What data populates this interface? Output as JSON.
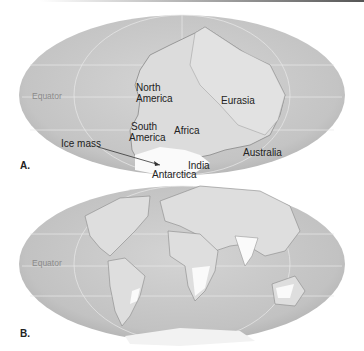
{
  "figure": {
    "panels": [
      {
        "id": "A",
        "label": "A.",
        "equator_label": "Equator",
        "continents": [
          "North America",
          "South America",
          "Africa",
          "Eurasia",
          "India",
          "Antarctica",
          "Australia"
        ],
        "annotations": [
          "Ice mass"
        ],
        "labels": {
          "north": "North",
          "america1": "America",
          "south": "South",
          "america2": "America",
          "africa": "Africa",
          "eurasia": "Eurasia",
          "ice_mass": "Ice mass",
          "india": "India",
          "antarctica": "Antarctica",
          "australia": "Australia"
        }
      },
      {
        "id": "B",
        "label": "B.",
        "equator_label": "Equator"
      }
    ]
  }
}
